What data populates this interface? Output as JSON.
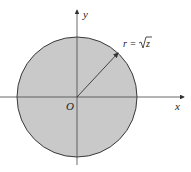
{
  "figure": {
    "axes": {
      "x_label": "x",
      "y_label": "y",
      "origin_label": "O"
    },
    "region": {
      "shape": "disk",
      "fill": "#c9c9c9",
      "stroke": "#3a3a3a"
    },
    "radius_label": {
      "lhs": "r =",
      "sqrt_arg": "z"
    }
  }
}
